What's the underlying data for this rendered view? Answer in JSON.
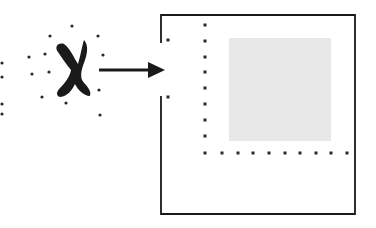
{
  "diagram": {
    "colors": {
      "background": "#ffffff",
      "ink": "#1a1a1a",
      "dot": "#2a2a2a",
      "fill_square": "#e8e8e8"
    },
    "glyph": {
      "symbol": "X",
      "center": [
        73,
        70
      ]
    },
    "scatter_dots": [
      [
        72,
        26
      ],
      [
        50,
        36
      ],
      [
        98,
        36
      ],
      [
        29,
        57
      ],
      [
        45,
        54
      ],
      [
        103,
        55
      ],
      [
        32,
        74
      ],
      [
        49,
        72
      ],
      [
        99,
        90
      ],
      [
        42,
        97
      ],
      [
        66,
        103
      ],
      [
        100,
        115
      ],
      [
        2,
        63
      ],
      [
        2,
        77
      ],
      [
        2,
        104
      ],
      [
        2,
        114
      ]
    ],
    "arrow": {
      "x1": 99,
      "y1": 70,
      "x2": 165,
      "y2": 70
    },
    "frame": {
      "x": 161,
      "y": 15,
      "width": 194,
      "height": 199,
      "gap_top": 43,
      "gap_bottom": 96
    },
    "gap_dots": [
      [
        168,
        40
      ],
      [
        168,
        97
      ]
    ],
    "dotted_vertical": {
      "x": 205,
      "ys": [
        25,
        41,
        57,
        72,
        88,
        104,
        120,
        136,
        153
      ]
    },
    "dotted_horizontal": {
      "y": 153,
      "xs": [
        222,
        238,
        253,
        269,
        285,
        300,
        316,
        331,
        347
      ]
    },
    "gray_square": {
      "x": 229,
      "y": 38,
      "width": 102,
      "height": 103
    }
  }
}
